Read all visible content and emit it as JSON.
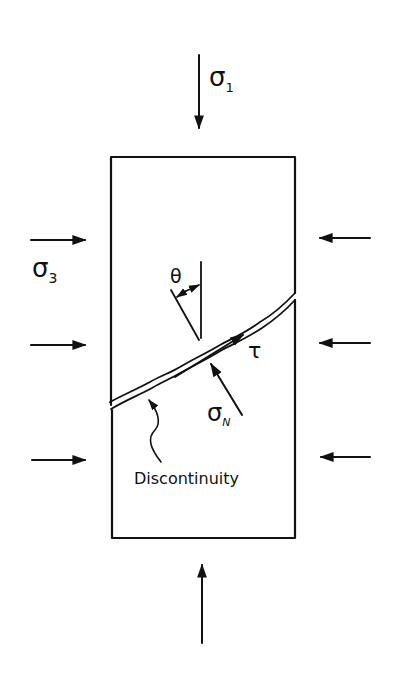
{
  "diagram": {
    "title": "",
    "specimen": {
      "x": 111,
      "y": 157,
      "width": 184,
      "height": 381
    },
    "labels": {
      "sigma1": "σ",
      "sigma1_sub": "1",
      "sigma3": "σ",
      "sigma3_sub": "3",
      "theta": "θ",
      "tau": "τ",
      "sigmaN": "σ",
      "sigmaN_sub": "N",
      "discontinuity": "Discontinuity"
    },
    "arrows": {
      "top": {
        "label": "sigma1",
        "direction": "down"
      },
      "bottom": {
        "direction": "up"
      },
      "left": {
        "count": 3,
        "direction": "right"
      },
      "right": {
        "count": 3,
        "direction": "left"
      }
    },
    "colors": {
      "ink": "#111111",
      "background": "#ffffff"
    }
  }
}
